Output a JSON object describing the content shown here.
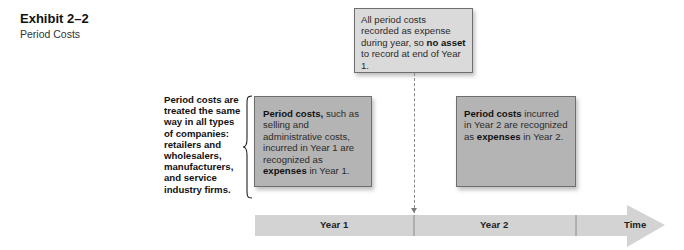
{
  "exhibit": {
    "number": "Exhibit 2–2",
    "title": "Period Costs"
  },
  "side_note": "Period costs are treated the same way in all types of companies: retailers and wholesalers, manufacturers, and service industry firms.",
  "top_box": {
    "text_1": "All period costs recorded as expense during year, so ",
    "bold_1": "no asset",
    "text_2": " to record at end of Year 1."
  },
  "left_box": {
    "bold_1": "Period costs,",
    "text_1": " such as selling and administrative costs, incurred in Year 1 are recognized as ",
    "bold_2": "expenses",
    "text_2": " in Year 1."
  },
  "right_box": {
    "bold_1": "Period costs",
    "text_1": " incurred in Year 2 are recognized as ",
    "bold_2": "expenses",
    "text_2": " in Year 2."
  },
  "timeline": {
    "segments": [
      "Year 1",
      "Year 2"
    ],
    "end_label": "Time"
  },
  "colors": {
    "top_box": "#dadada",
    "period_box": "#b4b4b4",
    "timeline": "#d3d3d3"
  }
}
